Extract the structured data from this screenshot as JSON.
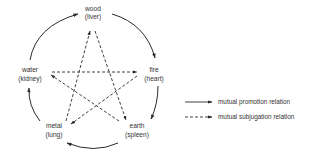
{
  "diagram": {
    "colors": {
      "line": "#2a2a2a",
      "text": "#333333",
      "background": "#ffffff"
    },
    "nodes": [
      {
        "id": "wood",
        "name": "wood",
        "organ": "(liver)",
        "x": 93,
        "y": 10
      },
      {
        "id": "fire",
        "name": "fire",
        "organ": "(heart)",
        "x": 154,
        "y": 70
      },
      {
        "id": "earth",
        "name": "earth",
        "organ": "(spleen)",
        "x": 137,
        "y": 127
      },
      {
        "id": "metal",
        "name": "metal",
        "organ": "(lung)",
        "x": 53,
        "y": 127
      },
      {
        "id": "water",
        "name": "water",
        "organ": "(kidney)",
        "x": 30,
        "y": 70
      }
    ],
    "promotion_edges": [
      {
        "from": "wood",
        "to": "fire"
      },
      {
        "from": "fire",
        "to": "earth"
      },
      {
        "from": "earth",
        "to": "metal"
      },
      {
        "from": "metal",
        "to": "water"
      },
      {
        "from": "water",
        "to": "wood"
      }
    ],
    "subjugation_edges": [
      {
        "from": "wood",
        "to": "earth"
      },
      {
        "from": "earth",
        "to": "water"
      },
      {
        "from": "water",
        "to": "fire"
      },
      {
        "from": "fire",
        "to": "metal"
      },
      {
        "from": "metal",
        "to": "wood"
      }
    ],
    "legend": {
      "items": [
        {
          "style": "solid",
          "label": "mutual promotion relation"
        },
        {
          "style": "dashed",
          "label": "mutual subjugation relation"
        }
      ]
    }
  }
}
